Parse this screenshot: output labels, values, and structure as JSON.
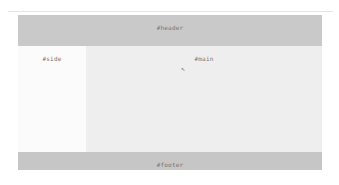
{
  "header": {
    "label": "#header"
  },
  "sidebar": {
    "label": "#side"
  },
  "main": {
    "label": "#main",
    "cursor_icon": "mouse-pointer-icon",
    "cursor_glyph": "↖"
  },
  "footer": {
    "label": "#footer"
  },
  "colors": {
    "header_bg": "#c9c9c9",
    "sidebar_bg": "#fbfbfb",
    "main_bg": "#eeeeee",
    "footer_bg": "#c6c6c6"
  }
}
